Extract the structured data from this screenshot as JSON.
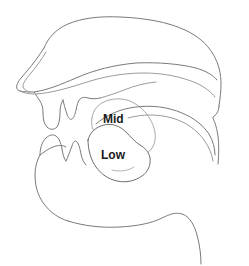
{
  "diagram": {
    "background_color": "#ffffff",
    "line_color": "#7a7a7a",
    "label_color": "#1a1a1a",
    "labels": [
      {
        "id": "mid",
        "text": "Mid",
        "x": 103,
        "y": 120,
        "meaning": "mid tongue height position"
      },
      {
        "id": "low",
        "text": "Low",
        "x": 101,
        "y": 156,
        "meaning": "low tongue height position"
      }
    ],
    "structures": [
      {
        "id": "head-outline",
        "name": "head-and-skull-outline"
      },
      {
        "id": "nose",
        "name": "nose-profile"
      },
      {
        "id": "nostril",
        "name": "nostril"
      },
      {
        "id": "nasal-cavity",
        "name": "nasal-cavity"
      },
      {
        "id": "hard-palate",
        "name": "hard-palate"
      },
      {
        "id": "soft-palate",
        "name": "soft-palate-velum"
      },
      {
        "id": "uvula",
        "name": "uvula"
      },
      {
        "id": "upper-lip",
        "name": "upper-lip"
      },
      {
        "id": "upper-teeth",
        "name": "upper-teeth"
      },
      {
        "id": "lower-lip",
        "name": "lower-lip"
      },
      {
        "id": "lower-teeth",
        "name": "lower-teeth"
      },
      {
        "id": "tongue-mid",
        "name": "tongue-mid-position"
      },
      {
        "id": "tongue-low",
        "name": "tongue-low-position"
      },
      {
        "id": "pharynx",
        "name": "pharyngeal-wall"
      },
      {
        "id": "jaw",
        "name": "lower-jaw-and-chin"
      },
      {
        "id": "neck",
        "name": "neck-line"
      }
    ]
  }
}
